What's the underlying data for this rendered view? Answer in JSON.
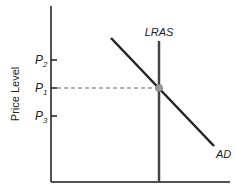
{
  "diagram": {
    "ylabel": "Price Level",
    "price_levels": [
      {
        "main": "P",
        "sub": "2"
      },
      {
        "main": "P",
        "sub": "1"
      },
      {
        "main": "P",
        "sub": "3"
      }
    ],
    "curves": {
      "lras": "LRAS",
      "ad": "AD"
    },
    "colors": {
      "axis": "#1a1a1a",
      "curve": "#222222",
      "lras": "#444444",
      "dash": "#666666",
      "point": "#999999"
    }
  }
}
